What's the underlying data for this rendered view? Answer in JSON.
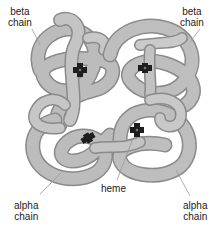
{
  "labels": {
    "beta_left": {
      "line1": "beta",
      "line2": "chain"
    },
    "beta_right": {
      "line1": "beta",
      "line2": "chain"
    },
    "alpha_left": {
      "line1": "alpha",
      "line2": "chain"
    },
    "alpha_right": {
      "line1": "alpha",
      "line2": "chain"
    },
    "heme": "heme"
  },
  "colors": {
    "chain_fill": "#b9b9b9",
    "chain_edge": "#8a8a8a",
    "chain_highlight": "#d8d8d8",
    "heme": "#1e1e1e",
    "leader_line": "#9a9a9a",
    "text": "#222222"
  },
  "heme_groups": [
    {
      "x": 80,
      "y": 70
    },
    {
      "x": 145,
      "y": 68
    },
    {
      "x": 88,
      "y": 138
    },
    {
      "x": 137,
      "y": 130
    }
  ]
}
